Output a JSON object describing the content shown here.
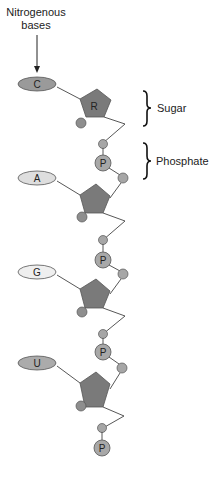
{
  "title": {
    "line1": "Nitrogenous",
    "line2": "bases"
  },
  "labels": {
    "sugar": "Sugar",
    "phosphate": "Phosphate",
    "sugar_letter": "R",
    "phosphate_letter": "P"
  },
  "nucleotides": [
    {
      "base": "C",
      "base_fill": "#9a9a9a"
    },
    {
      "base": "A",
      "base_fill": "#dedede"
    },
    {
      "base": "G",
      "base_fill": "#efefef"
    },
    {
      "base": "U",
      "base_fill": "#ababab"
    }
  ],
  "colors": {
    "sugar_fill": "#7a7a7a",
    "phosphate_fill": "#a8a8a8",
    "small_circle_fill": "#9e9e9e",
    "stroke": "#444444"
  }
}
